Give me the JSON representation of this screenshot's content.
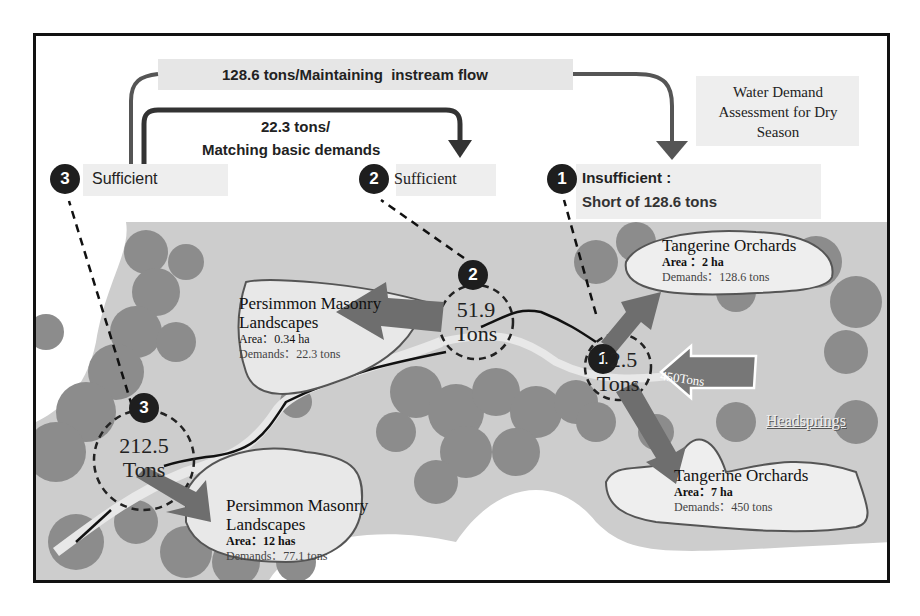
{
  "title": "Water Demand Assessment for Dry Season",
  "flows": {
    "top": "128.6 tons/Maintaining  instream flow",
    "middle_line1": "22.3 tons/",
    "middle_line2": "Matching basic demands"
  },
  "status": [
    {
      "num": "3",
      "label": "Sufficient"
    },
    {
      "num": "2",
      "label": "Sufficient"
    },
    {
      "num": "1",
      "label_line1": "Insufficient :",
      "label_line2": "Short of 128.6 tons"
    }
  ],
  "nodes": [
    {
      "num": "1",
      "value": "12.5",
      "unit": "Tons"
    },
    {
      "num": "2",
      "value": "51.9",
      "unit": "Tons"
    },
    {
      "num": "3",
      "value": "212.5",
      "unit": "Tons"
    }
  ],
  "inflow": {
    "label": "450Tons",
    "source": "Headsprings"
  },
  "areas": [
    {
      "name": "Tangerine Orchards",
      "area": "Area ：2 ha",
      "demands": "Demands：128.6 tons"
    },
    {
      "name": "Tangerine Orchards",
      "area": "Area：7 ha",
      "demands": "Demands：450 tons"
    },
    {
      "name_line1": "Persimmon Masonry",
      "name_line2": "Landscapes",
      "area": "Area：0.34 ha",
      "demands": "Demands：22.3 tons"
    },
    {
      "name_line1": "Persimmon Masonry",
      "name_line2": "Landscapes",
      "area": "Area：12 has",
      "demands": "Demands：77.1 tons"
    }
  ],
  "colors": {
    "map": "#c9c9c9",
    "trees": "#8a8a8a",
    "arrow": "#6e6e6e",
    "badge": "#1e1e1e",
    "box": "#e6e6e6"
  }
}
